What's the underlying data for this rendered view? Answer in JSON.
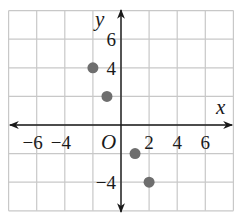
{
  "chart_data": {
    "type": "scatter",
    "title": "",
    "xlabel": "x",
    "ylabel": "y",
    "origin_label": "O",
    "xlim": [
      -8,
      8
    ],
    "ylim": [
      -6,
      8
    ],
    "grid": true,
    "grid_step": 2,
    "x_ticks": [
      {
        "value": -6,
        "label": "−6"
      },
      {
        "value": -4,
        "label": "−4"
      },
      {
        "value": 2,
        "label": "2"
      },
      {
        "value": 4,
        "label": "4"
      },
      {
        "value": 6,
        "label": "6"
      }
    ],
    "y_ticks": [
      {
        "value": 6,
        "label": "6"
      },
      {
        "value": 4,
        "label": "4"
      },
      {
        "value": -4,
        "label": "−4"
      }
    ],
    "points": [
      {
        "x": -2,
        "y": 4
      },
      {
        "x": -1,
        "y": 2
      },
      {
        "x": 1,
        "y": -2
      },
      {
        "x": 2,
        "y": -4
      }
    ],
    "legend": null,
    "colors": {
      "point": "#6e6e6e",
      "grid": "#c8c8c8",
      "axis": "#1a1a1a"
    }
  }
}
